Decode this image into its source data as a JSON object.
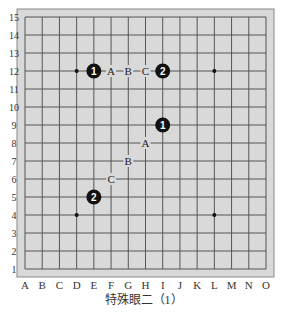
{
  "diagram": {
    "title": "特殊眼二（1）",
    "board": {
      "columns": [
        "A",
        "B",
        "C",
        "D",
        "E",
        "F",
        "G",
        "H",
        "I",
        "J",
        "K",
        "L",
        "M",
        "N",
        "O"
      ],
      "rows": [
        "1",
        "2",
        "3",
        "4",
        "5",
        "6",
        "7",
        "8",
        "9",
        "10",
        "11",
        "12",
        "13",
        "14",
        "15"
      ],
      "background_color": "#d9d9d9",
      "line_color": "#555555"
    },
    "star_points": [
      {
        "col": "D",
        "row": 12
      },
      {
        "col": "L",
        "row": 12
      },
      {
        "col": "D",
        "row": 4
      },
      {
        "col": "L",
        "row": 4
      }
    ],
    "stones": [
      {
        "col": "E",
        "row": 12,
        "color": "black",
        "label": "1"
      },
      {
        "col": "I",
        "row": 12,
        "color": "black",
        "label": "2"
      },
      {
        "col": "I",
        "row": 9,
        "color": "black",
        "label": "1"
      },
      {
        "col": "E",
        "row": 5,
        "color": "black",
        "label": "2"
      }
    ],
    "marks": [
      {
        "col": "F",
        "row": 12,
        "label": "A"
      },
      {
        "col": "G",
        "row": 12,
        "label": "B"
      },
      {
        "col": "H",
        "row": 12,
        "label": "C"
      },
      {
        "col": "H",
        "row": 8,
        "label": "A"
      },
      {
        "col": "G",
        "row": 7,
        "label": "B"
      },
      {
        "col": "F",
        "row": 6,
        "label": "C"
      }
    ]
  }
}
